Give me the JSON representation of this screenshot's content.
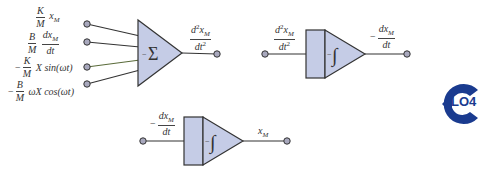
{
  "diagram": {
    "colors": {
      "block_fill": "#c5cce6",
      "stroke": "#333333",
      "node_fill": "#a8a8bd",
      "logo": "#1a3b8f"
    },
    "summer": {
      "symbol": "Σ",
      "sign": "−",
      "inputs": [
        {
          "sign": "",
          "coef_num": "K",
          "coef_den": "M",
          "term": "x",
          "term_sub": "M"
        },
        {
          "sign": "",
          "coef_num": "B",
          "coef_den": "M",
          "frac2_num": "dx",
          "frac2_num_sub": "M",
          "frac2_den": "dt"
        },
        {
          "sign": "−",
          "coef_num": "K",
          "coef_den": "M",
          "term": "X sin(ωt)"
        },
        {
          "sign": "−",
          "coef_num": "B",
          "coef_den": "M",
          "term": "ωX cos(ωt)"
        }
      ],
      "output": {
        "num": "d",
        "num_sup": "2",
        "num_var": "x",
        "num_sub": "M",
        "den": "dt",
        "den_sup": "2"
      }
    },
    "integrator1": {
      "symbol": "∫",
      "sign": "−",
      "input": {
        "num": "d",
        "num_sup": "2",
        "num_var": "x",
        "num_sub": "M",
        "den": "dt",
        "den_sup": "2"
      },
      "output": {
        "sign": "−",
        "num": "dx",
        "num_sub": "M",
        "den": "dt"
      }
    },
    "integrator2": {
      "symbol": "∫",
      "sign": "−",
      "input": {
        "sign": "−",
        "num": "dx",
        "num_sub": "M",
        "den": "dt"
      },
      "output": {
        "var": "x",
        "sub": "M"
      }
    },
    "badge": {
      "label": "LO4"
    }
  }
}
